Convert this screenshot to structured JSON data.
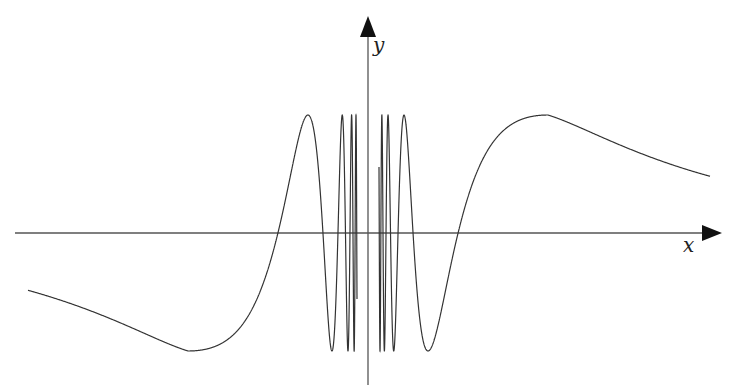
{
  "diagram": {
    "function": "y = sin(a/x) style oscillation, undefined near x = 0",
    "x_axis_label": "x",
    "y_axis_label": "y",
    "colors": {
      "curve": "#333333",
      "axes": "#555555",
      "arrow": "#111111"
    }
  }
}
